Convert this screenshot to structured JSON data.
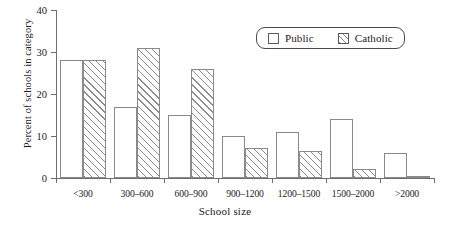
{
  "chart_data": {
    "type": "bar",
    "title": "",
    "xlabel": "School size",
    "ylabel": "Percent of schools in category",
    "categories": [
      "<300",
      "300–600",
      "600–900",
      "900–1200",
      "1200–1500",
      "1500–2000",
      ">2000"
    ],
    "series": [
      {
        "name": "Public",
        "values": [
          28,
          17,
          15,
          10,
          11,
          14,
          6
        ]
      },
      {
        "name": "Catholic",
        "values": [
          28,
          31,
          26,
          7.2,
          6.4,
          2.1,
          0.5
        ]
      }
    ],
    "ylim": [
      0,
      40
    ],
    "yticks": [
      0,
      10,
      20,
      30,
      40
    ],
    "ytick_labels": [
      "0",
      "10",
      "20",
      "30",
      "40"
    ],
    "grid": false,
    "legend_position": "top-right",
    "legend_entries": [
      {
        "label": "Public",
        "swatch": "empty-square"
      },
      {
        "label": "Catholic",
        "swatch": "hatched-square"
      }
    ]
  }
}
